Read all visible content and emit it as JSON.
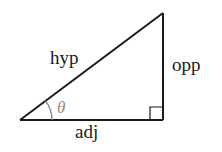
{
  "diagram": {
    "type": "right-triangle",
    "labels": {
      "hypotenuse": "hyp",
      "opposite": "opp",
      "adjacent": "adj",
      "angle": "θ"
    },
    "colors": {
      "stroke": "#1a1a1a",
      "angle_arc": "#8a8a8a",
      "angle_label": "#8a8a8a",
      "background": "#ffffff"
    },
    "vertices": {
      "angle_vertex": [
        20,
        120
      ],
      "right_angle_vertex": [
        163,
        120
      ],
      "top_vertex": [
        163,
        13
      ]
    }
  }
}
